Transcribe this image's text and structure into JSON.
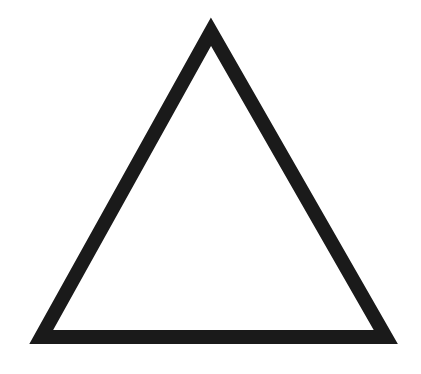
{
  "diagram": {
    "shape": "triangle",
    "type": "equilateral-outline",
    "stroke_color": "#1a1a1a",
    "fill_color": "#ffffff",
    "background_color": "#ffffff",
    "stroke_width": 14,
    "vertices": {
      "apex": [
        211,
        24
      ],
      "bottom_left": [
        30,
        344
      ],
      "bottom_right": [
        397,
        344
      ]
    }
  }
}
